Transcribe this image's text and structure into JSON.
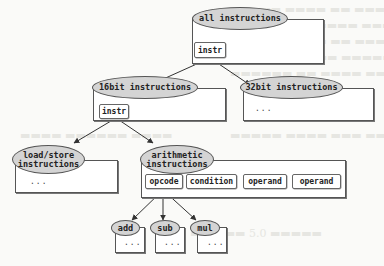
{
  "diagram": {
    "type": "instruction-hierarchy-tree",
    "nodes": {
      "all": {
        "label": "all instructions",
        "field": "instr"
      },
      "bit16": {
        "label": "16bit instructions",
        "field": "instr"
      },
      "bit32": {
        "label": "32bit instructions",
        "content": "..."
      },
      "loadstore": {
        "label": "load/store instructions",
        "label_line1": "load/store",
        "label_line2": "instructions",
        "content": "..."
      },
      "arith": {
        "label": "arithmetic instructions",
        "label_line1": "arithmetic",
        "label_line2": "instructions",
        "fields": [
          "opcode",
          "condition",
          "operand",
          "operand"
        ]
      },
      "add": {
        "label": "add",
        "content": "..."
      },
      "sub": {
        "label": "sub",
        "content": "..."
      },
      "mul": {
        "label": "mul",
        "content": "..."
      }
    },
    "edges": [
      {
        "from": "all.instr",
        "to": "bit16"
      },
      {
        "from": "all.instr",
        "to": "bit32"
      },
      {
        "from": "bit16.instr",
        "to": "loadstore"
      },
      {
        "from": "bit16.instr",
        "to": "arith"
      },
      {
        "from": "arith.opcode",
        "to": "add"
      },
      {
        "from": "arith.opcode",
        "to": "sub"
      },
      {
        "from": "arith.opcode",
        "to": "mul"
      }
    ],
    "colors": {
      "ellipse_fill": "#d4d4d4",
      "stroke": "#555555",
      "box_fill": "#ffffff",
      "background": "#fafaf8"
    }
  }
}
